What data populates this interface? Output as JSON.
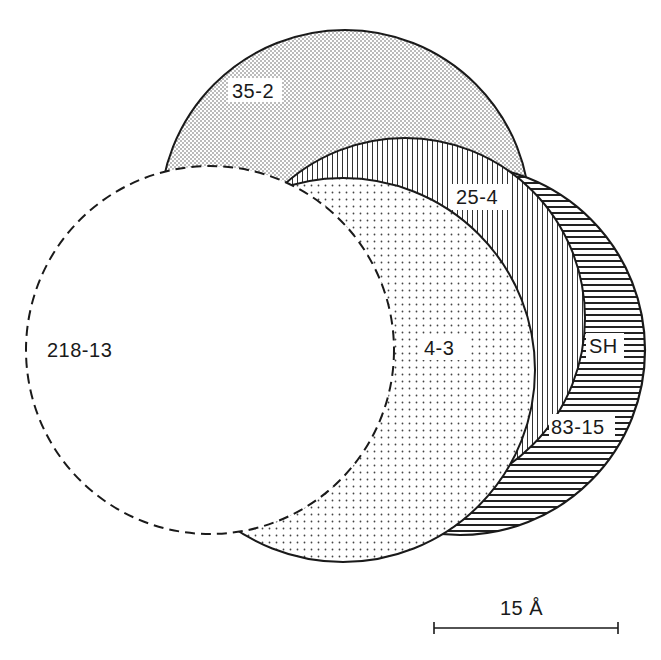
{
  "figure": {
    "colors": {
      "stroke": "#1a1a1a",
      "background": "#ffffff",
      "pattern_ink": "#2a2a2a"
    }
  },
  "shapes": [
    {
      "id": "35-2",
      "label": "35-2",
      "fill_pattern": "fine-dense-dots",
      "outline": "solid",
      "cx": 345,
      "cy": 215,
      "r": 185,
      "label_pos": [
        218,
        96
      ]
    },
    {
      "id": "25-4",
      "label": "25-4",
      "fill_pattern": "vertical-lines",
      "outline": "solid",
      "cx": 405,
      "cy": 318,
      "r": 180,
      "label_pos": [
        458,
        202
      ]
    },
    {
      "id": "SH",
      "label": "SH",
      "fill_pattern": "horizontal-lines",
      "outline": "solid",
      "cx": 460,
      "cy": 350,
      "r": 185,
      "label_pos": [
        587,
        352
      ]
    },
    {
      "id": "83-15",
      "label": "83-15",
      "fill_pattern": "horizontal-lines",
      "outline": "solid",
      "label_pos": [
        549,
        433
      ]
    },
    {
      "id": "4-3",
      "label": "4-3",
      "fill_pattern": "sparse-dots",
      "outline": "solid",
      "cx": 343,
      "cy": 370,
      "r": 192,
      "label_pos": [
        421,
        352
      ]
    },
    {
      "id": "218-13",
      "label": "218-13",
      "fill_pattern": "none",
      "outline": "dashed",
      "cx": 210,
      "cy": 350,
      "r": 184,
      "label_pos": [
        46,
        356
      ]
    }
  ],
  "labels": {
    "l_35_2": "35-2",
    "l_25_4": "25-4",
    "l_sh": "SH",
    "l_83_15": "83-15",
    "l_4_3": "4-3",
    "l_218_13": "218-13"
  },
  "scale_bar": {
    "label": "15 Å",
    "value": 15,
    "unit": "Å",
    "x1": 434,
    "x2": 618,
    "y": 628
  }
}
